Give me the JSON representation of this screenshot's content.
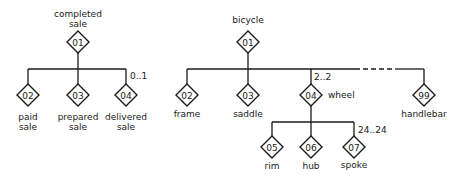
{
  "diagrams": [
    {
      "root": {
        "id": "01",
        "label_line1": "completed",
        "label_line2": "sale"
      },
      "children": [
        {
          "id": "02",
          "label_line1": "paid",
          "label_line2": "sale"
        },
        {
          "id": "03",
          "label_line1": "prepared",
          "label_line2": "sale"
        },
        {
          "id": "04",
          "label_line1": "delivered",
          "label_line2": "sale",
          "multiplicity": "0..1"
        }
      ]
    },
    {
      "root": {
        "id": "01",
        "label": "bicycle"
      },
      "children": [
        {
          "id": "02",
          "label": "frame"
        },
        {
          "id": "03",
          "label": "saddle"
        },
        {
          "id": "04",
          "label": "wheel",
          "multiplicity": "2..2",
          "children": [
            {
              "id": "05",
              "label": "rim"
            },
            {
              "id": "06",
              "label": "hub"
            },
            {
              "id": "07",
              "label": "spoke",
              "multiplicity": "24..24"
            }
          ]
        },
        {
          "id": "99",
          "label": "handlebar"
        }
      ]
    }
  ]
}
